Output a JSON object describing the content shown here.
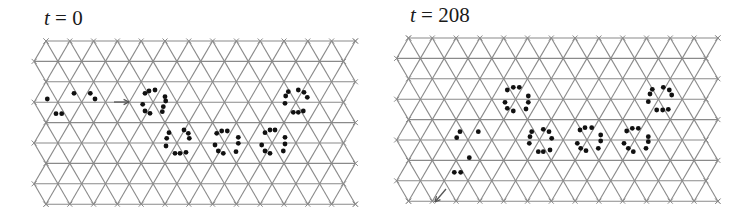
{
  "figure": {
    "lattice": {
      "type": "triangular",
      "rows": 9,
      "nodes_per_row": 14,
      "spacing_x": 23.8,
      "spacing_y": 20.4,
      "line_color": "#8a8a8a",
      "node_marker_color": "#8a8a8a"
    },
    "dot_color": "#111111",
    "panels": [
      {
        "id": "left",
        "label_var": "t",
        "label_eq": " = ",
        "label_value": "0",
        "offset_x": 0,
        "origin": [
          46,
          41
        ],
        "label_pos": [
          44,
          8
        ],
        "arrow": {
          "from": [
            114,
            102
          ],
          "to": [
            129,
            102
          ]
        },
        "dots": [
          [
            47.3,
            99
          ],
          [
            56,
            113.7
          ],
          [
            61.7,
            113.7
          ],
          [
            74,
            93.3
          ],
          [
            90.3,
            93.3
          ],
          [
            95,
            99
          ],
          [
            145,
            93.3
          ],
          [
            149,
            91
          ],
          [
            155,
            90
          ],
          [
            165,
            96.7
          ],
          [
            165.7,
            101
          ],
          [
            142.7,
            104.3
          ],
          [
            145,
            111
          ],
          [
            150,
            113.3
          ],
          [
            162.3,
            111.7
          ],
          [
            163.3,
            106.7
          ],
          [
            169,
            132.7
          ],
          [
            166.7,
            138.3
          ],
          [
            166,
            146
          ],
          [
            184,
            130
          ],
          [
            188.3,
            133.3
          ],
          [
            189.3,
            138.3
          ],
          [
            175,
            153.3
          ],
          [
            180,
            153.3
          ],
          [
            186,
            152.3
          ],
          [
            216.7,
            133.3
          ],
          [
            221.7,
            131
          ],
          [
            227.3,
            131
          ],
          [
            238.3,
            137.3
          ],
          [
            238.3,
            143.3
          ],
          [
            236,
            151.7
          ],
          [
            215,
            145
          ],
          [
            218.3,
            151
          ],
          [
            223.3,
            153.3
          ],
          [
            265,
            132.7
          ],
          [
            270,
            130
          ],
          [
            275,
            130
          ],
          [
            285,
            137.3
          ],
          [
            285,
            144
          ],
          [
            283.3,
            151
          ],
          [
            261.7,
            145
          ],
          [
            265,
            151
          ],
          [
            270,
            153.3
          ],
          [
            288.3,
            91.7
          ],
          [
            285.7,
            96
          ],
          [
            285,
            103.3
          ],
          [
            298.3,
            90
          ],
          [
            304,
            92.3
          ],
          [
            307.3,
            97.3
          ],
          [
            293.3,
            112.3
          ],
          [
            298.3,
            112.3
          ],
          [
            303.3,
            111
          ]
        ]
      },
      {
        "id": "right",
        "label_var": "t",
        "label_eq": " = ",
        "label_value": "208",
        "offset_x": 376,
        "origin": [
          408.5,
          38
        ],
        "label_pos": [
          410,
          5
        ],
        "arrow": {
          "from": [
            446,
            189
          ],
          "to": [
            435,
            202
          ]
        },
        "dots": [
          [
            460,
            131.7
          ],
          [
            456.7,
            137.7
          ],
          [
            478.3,
            131.7
          ],
          [
            469.3,
            157.7
          ],
          [
            454.3,
            172.3
          ],
          [
            460.7,
            172.3
          ],
          [
            507.3,
            90
          ],
          [
            513.3,
            87.3
          ],
          [
            519.3,
            87.3
          ],
          [
            528.3,
            96
          ],
          [
            528.3,
            102.3
          ],
          [
            526,
            109
          ],
          [
            505,
            102.3
          ],
          [
            507.3,
            108.3
          ],
          [
            513.3,
            111
          ],
          [
            531.7,
            131.7
          ],
          [
            530,
            136.7
          ],
          [
            529.3,
            143.3
          ],
          [
            543.3,
            129.3
          ],
          [
            549,
            131.7
          ],
          [
            551.7,
            138.3
          ],
          [
            538.3,
            151.7
          ],
          [
            543.3,
            151.7
          ],
          [
            550,
            150
          ],
          [
            580,
            130
          ],
          [
            585,
            127.7
          ],
          [
            591.7,
            127.7
          ],
          [
            600.7,
            135
          ],
          [
            600.7,
            141
          ],
          [
            598.3,
            148.3
          ],
          [
            577.3,
            143.3
          ],
          [
            580.7,
            148.3
          ],
          [
            586,
            150.7
          ],
          [
            626.7,
            131
          ],
          [
            632.3,
            128.3
          ],
          [
            638.3,
            128.3
          ],
          [
            648.3,
            136.7
          ],
          [
            648.3,
            141.7
          ],
          [
            646,
            148.3
          ],
          [
            624,
            143.3
          ],
          [
            628.3,
            148.3
          ],
          [
            633.3,
            151.7
          ],
          [
            652.3,
            89.3
          ],
          [
            650,
            94
          ],
          [
            648.3,
            101.7
          ],
          [
            663.3,
            87.3
          ],
          [
            669.3,
            90
          ],
          [
            671.7,
            95
          ],
          [
            656.7,
            110
          ],
          [
            662.7,
            110
          ],
          [
            668.3,
            109.3
          ]
        ]
      }
    ]
  }
}
